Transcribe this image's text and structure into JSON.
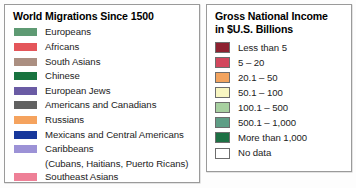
{
  "migrations": {
    "title": "World Migrations Since 1500",
    "items": [
      {
        "label": "Europeans",
        "color": "#5e9a73"
      },
      {
        "label": "Africans",
        "color": "#e4565a"
      },
      {
        "label": "South Asians",
        "color": "#ab8f81"
      },
      {
        "label": "Chinese",
        "color": "#18733f"
      },
      {
        "label": "European Jews",
        "color": "#6a5ba4"
      },
      {
        "label": "Americans and Canadians",
        "color": "#616161"
      },
      {
        "label": "Russians",
        "color": "#f5a35e"
      },
      {
        "label": "Mexicans and Central Americans",
        "color": "#17379b"
      },
      {
        "label": "Caribbeans",
        "sublabel": "(Cubans, Haitians, Puerto Ricans)",
        "color": "#9c92d6"
      },
      {
        "label": "Southeast Asians",
        "color": "#ee8097"
      }
    ]
  },
  "gni": {
    "title_line1": "Gross National Income",
    "title_line2": "in $U.S. Billions",
    "items": [
      {
        "label": "Less than 5",
        "color": "#8e2130"
      },
      {
        "label": "5 – 20",
        "color": "#d2475d"
      },
      {
        "label": "20.1 – 50",
        "color": "#f2a35e"
      },
      {
        "label": "50.1 – 100",
        "color": "#f8f6c2"
      },
      {
        "label": "100.1 – 500",
        "color": "#a7d0a0"
      },
      {
        "label": "500.1 – 1,000",
        "color": "#5f9e86"
      },
      {
        "label": "More than 1,000",
        "color": "#1d7044"
      },
      {
        "label": "No data",
        "color": "#ffffff"
      }
    ]
  }
}
